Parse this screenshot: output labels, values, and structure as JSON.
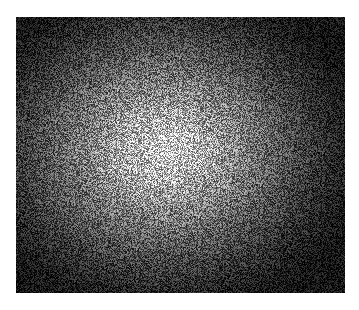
{
  "image": {
    "description": "Grayscale noise field with a bright radial center fading to dark edges",
    "background_color": "#ffffff",
    "center_color": "#d8d8d8",
    "edge_color": "#141414"
  }
}
